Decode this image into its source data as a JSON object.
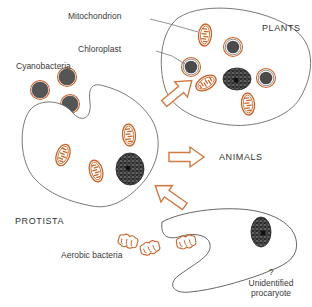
{
  "diagram": {
    "labels": {
      "mitochondrion": "Mitochondrion",
      "chloroplast": "Chloroplast",
      "cyanobacteria": "Cyanobacteria",
      "plants": "PLANTS",
      "animals": "ANIMALS",
      "protista": "PROTISTA",
      "aerobic_bacteria": "Aerobic bacteria",
      "question_mark": "?",
      "unidentified_line1": "Unidentified",
      "unidentified_line2": "procaryote"
    },
    "nodes": [
      {
        "id": "unidentified-procaryote",
        "label": "? Unidentified procaryote"
      },
      {
        "id": "protista",
        "label": "PROTISTA"
      },
      {
        "id": "plants",
        "label": "PLANTS"
      },
      {
        "id": "animals",
        "label": "ANIMALS"
      },
      {
        "id": "aerobic-bacteria",
        "label": "Aerobic bacteria"
      },
      {
        "id": "cyanobacteria",
        "label": "Cyanobacteria"
      }
    ],
    "edges": [
      {
        "from": "unidentified-procaryote",
        "to": "protista"
      },
      {
        "from": "protista",
        "to": "plants"
      },
      {
        "from": "protista",
        "to": "animals"
      }
    ],
    "colors": {
      "outline": "#6a6a6a",
      "arrow": "#d07a45",
      "mitochondrion": "#c8642a",
      "chloroplast_fill": "#4a4a4a",
      "chloroplast_ring": "#c8642a",
      "nucleus": "#2a2a2a",
      "text": "#3a3a3a"
    }
  }
}
